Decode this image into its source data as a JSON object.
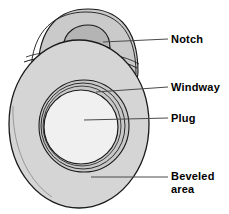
{
  "figure": {
    "background": "#ffffff",
    "width": 229,
    "height": 214
  },
  "colors": {
    "outline": "#1a1a1a",
    "body_fill": "#d5d5d5",
    "top_fill": "#cacaca",
    "notch_fill": "#b4b4b4",
    "windway_fill": "#c8c8c8",
    "plug_fill": "#f0f0f0",
    "leader_line": "#4a4a4a",
    "label_text": "#000000"
  },
  "labels": [
    {
      "id": "notch",
      "text": "Notch",
      "x": 171,
      "y": 33
    },
    {
      "id": "windway",
      "text": "Windway",
      "x": 171,
      "y": 81
    },
    {
      "id": "plug",
      "text": "Plug",
      "x": 171,
      "y": 112
    },
    {
      "id": "beveled",
      "text": "Beveled\narea",
      "x": 171,
      "y": 170
    }
  ],
  "leaders": [
    {
      "id": "notch",
      "x1": 103,
      "y1": 42,
      "x2": 168,
      "y2": 39
    },
    {
      "id": "windway",
      "x1": 96,
      "y1": 92,
      "x2": 168,
      "y2": 87
    },
    {
      "id": "plug",
      "x1": 84,
      "y1": 120,
      "x2": 168,
      "y2": 118
    },
    {
      "id": "beveled",
      "x1": 91,
      "y1": 177,
      "x2": 168,
      "y2": 177
    }
  ],
  "parts": {
    "beveled_area": "Beveled area",
    "plug": "Plug",
    "windway": "Windway",
    "notch": "Notch"
  }
}
